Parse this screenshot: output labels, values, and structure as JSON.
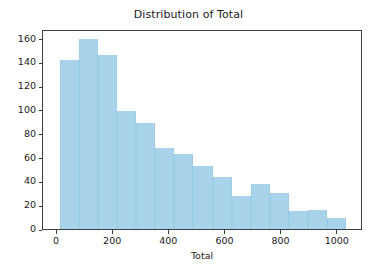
{
  "chart_data": {
    "type": "bar",
    "title": "Distribution of Total",
    "xlabel": "Total",
    "ylabel": "",
    "xlim": [
      -50,
      1090
    ],
    "ylim": [
      0,
      168
    ],
    "grid": false,
    "legend": null,
    "bar_color": "#a8d3ea",
    "edge_color": "#9ecce6",
    "axes_color": "#3d3d3d",
    "bin_edges": [
      10,
      78,
      146,
      214,
      282,
      350,
      418,
      486,
      554,
      622,
      690,
      758,
      826,
      894,
      962,
      1030
    ],
    "bin_centers": [
      44,
      112,
      180,
      248,
      316,
      384,
      452,
      520,
      588,
      656,
      724,
      792,
      860,
      928,
      996
    ],
    "values": [
      142,
      160,
      146,
      99,
      89,
      68,
      63,
      53,
      44,
      28,
      38,
      30,
      15,
      16,
      9
    ],
    "x_ticks": [
      {
        "value": 0,
        "label": "0"
      },
      {
        "value": 200,
        "label": "200"
      },
      {
        "value": 400,
        "label": "400"
      },
      {
        "value": 600,
        "label": "600"
      },
      {
        "value": 800,
        "label": "800"
      },
      {
        "value": 1000,
        "label": "1000"
      }
    ],
    "y_ticks": [
      {
        "value": 0,
        "label": "0"
      },
      {
        "value": 20,
        "label": "20"
      },
      {
        "value": 40,
        "label": "40"
      },
      {
        "value": 60,
        "label": "60"
      },
      {
        "value": 80,
        "label": "80"
      },
      {
        "value": 100,
        "label": "100"
      },
      {
        "value": 120,
        "label": "120"
      },
      {
        "value": 140,
        "label": "140"
      },
      {
        "value": 160,
        "label": "160"
      }
    ]
  }
}
